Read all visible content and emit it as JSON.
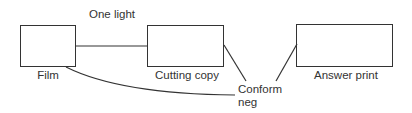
{
  "diagram": {
    "title_label": "One light",
    "nodes": [
      {
        "id": "film",
        "label": "Film"
      },
      {
        "id": "cutting_copy",
        "label": "Cutting copy"
      },
      {
        "id": "answer_print",
        "label": "Answer print"
      }
    ],
    "junction": {
      "id": "conform_neg",
      "label_line1": "Conform",
      "label_line2": "neg"
    },
    "edges": [
      {
        "from": "film",
        "to": "cutting_copy",
        "label": "One light",
        "style": "straight"
      },
      {
        "from": "film",
        "to": "conform_neg",
        "style": "curve"
      },
      {
        "from": "cutting_copy",
        "to": "conform_neg",
        "style": "straight"
      },
      {
        "from": "conform_neg",
        "to": "answer_print",
        "style": "straight"
      }
    ],
    "line_color": "#333333"
  }
}
